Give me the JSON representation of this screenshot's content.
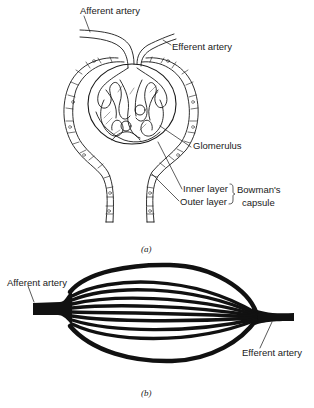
{
  "figure": {
    "panel_a": {
      "caption": "(a)",
      "labels": {
        "afferent_artery": "Afferent artery",
        "efferent_artery": "Efferent artery",
        "glomerulus": "Glomerulus",
        "inner_layer": "Inner layer",
        "outer_layer": "Outer layer",
        "bowmans_capsule_line1": "Bowman's",
        "bowmans_capsule_line2": "capsule"
      }
    },
    "panel_b": {
      "caption": "(b)",
      "labels": {
        "afferent_artery": "Afferent artery",
        "efferent_artery": "Efferent artery"
      },
      "capillary_count": 8
    },
    "colors": {
      "ink": "#1a1a1a",
      "background": "#ffffff"
    }
  }
}
